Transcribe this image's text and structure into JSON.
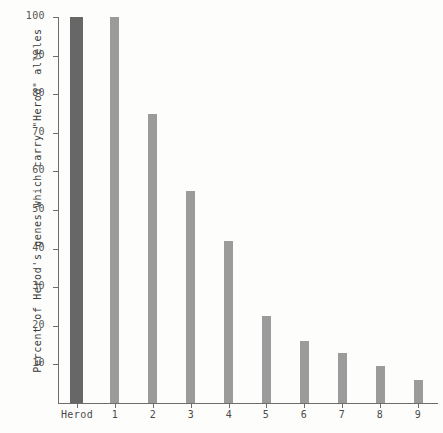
{
  "chart_data": {
    "type": "bar",
    "title": "",
    "xlabel": "",
    "ylabel": "Percent of Herod's genes which carry \"Herod\" alleles",
    "categories": [
      "Herod",
      "1",
      "2",
      "3",
      "4",
      "5",
      "6",
      "7",
      "8",
      "9"
    ],
    "values": [
      100,
      100,
      75,
      55,
      42,
      22.5,
      16,
      13,
      9.5,
      6
    ],
    "ylim": [
      0,
      100
    ],
    "yticks": [
      10,
      20,
      30,
      40,
      50,
      60,
      70,
      80,
      90,
      100
    ],
    "ytick_labels": [
      "10",
      "20",
      "30",
      "40",
      "50",
      "60",
      "70",
      "80",
      "90",
      "100"
    ],
    "grid": false,
    "legend": null,
    "series": [
      {
        "name": "Percent of Herod's genes which carry \"Herod\" alleles",
        "values": [
          100,
          100,
          75,
          55,
          42,
          22.5,
          16,
          13,
          9.5,
          6
        ]
      }
    ],
    "bar_colors": [
      "#676767",
      "#9b9b9b",
      "#9b9b9b",
      "#9b9b9b",
      "#9b9b9b",
      "#9b9b9b",
      "#9b9b9b",
      "#9b9b9b",
      "#9b9b9b",
      "#9b9b9b"
    ],
    "bar_widths": [
      13,
      9,
      9,
      9,
      9,
      9,
      9,
      9,
      9,
      9
    ],
    "background_color": "#fdfdfc",
    "axis_color": "#6d6d6d"
  }
}
